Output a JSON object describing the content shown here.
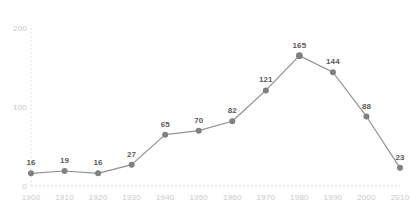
{
  "chart_data": {
    "type": "line",
    "title": "",
    "subtitle": "",
    "xlabel": "",
    "ylabel": "",
    "categories": [
      "1900",
      "1910",
      "1920",
      "1930",
      "1940",
      "1950",
      "1960",
      "1970",
      "1980",
      "1990",
      "2000",
      "2010"
    ],
    "values": [
      16,
      19,
      16,
      27,
      65,
      70,
      82,
      121,
      165,
      144,
      88,
      23
    ],
    "point_labels": [
      "16",
      "19",
      "16",
      "27",
      "65",
      "70",
      "82",
      "121",
      "165",
      "144",
      "88",
      "23"
    ],
    "series": [
      {
        "name": "",
        "values": [
          16,
          19,
          16,
          27,
          65,
          70,
          82,
          121,
          165,
          144,
          88,
          23
        ]
      }
    ],
    "ylim": [
      0,
      200
    ],
    "ytick_labels": [
      "0",
      "100",
      "200"
    ],
    "ytick_values": [
      0,
      100,
      200
    ],
    "xtick_labels": [
      "1900",
      "1910",
      "1920",
      "1930",
      "1940",
      "1950",
      "1960",
      "1970",
      "1980",
      "1990",
      "2000",
      "2010"
    ],
    "grid": "dotted-baseline-and-left-axis",
    "legend": "none",
    "annotations": "value labels above each marker",
    "colors": {
      "line": "#8f8f8f",
      "marker": "#808080",
      "label_text": "#5a5a5a",
      "tick_text": "#cccccc",
      "grid": "#e2e2e2",
      "background": "#ffffff"
    }
  }
}
